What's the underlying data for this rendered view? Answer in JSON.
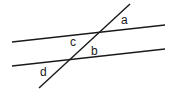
{
  "diagram": {
    "colors": {
      "line": "#1a1a1a",
      "background": "#ffffff"
    },
    "lines": [
      {
        "id": "parallel-upper",
        "x1": 12,
        "y1": 42,
        "x2": 165,
        "y2": 25
      },
      {
        "id": "parallel-lower",
        "x1": 12,
        "y1": 66,
        "x2": 165,
        "y2": 49
      },
      {
        "id": "transversal",
        "x1": 39,
        "y1": 88,
        "x2": 130,
        "y2": 4
      }
    ],
    "labels": [
      {
        "id": "a",
        "text": "a",
        "x": 121,
        "y": 24
      },
      {
        "id": "b",
        "text": "b",
        "x": 91,
        "y": 55
      },
      {
        "id": "c",
        "text": "c",
        "x": 70,
        "y": 46
      },
      {
        "id": "d",
        "text": "d",
        "x": 40,
        "y": 76
      }
    ]
  }
}
